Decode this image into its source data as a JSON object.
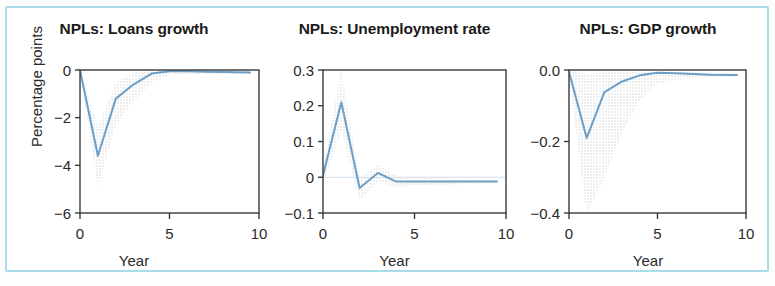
{
  "figure": {
    "border_color": "#a8dce8",
    "background": "#ffffff",
    "line_color": "#6d9ec6",
    "band_color": "#d6d6d6"
  },
  "panels": [
    {
      "id": "npls-loans-growth",
      "title": "NPLs: Loans growth",
      "xlabel": "Year",
      "ylabel": "Percentage points",
      "yticks": [
        "0",
        "−2",
        "−4",
        "−6"
      ],
      "xticks": [
        "0",
        "5",
        "10"
      ]
    },
    {
      "id": "npls-unemployment-rate",
      "title": "NPLs: Unemployment rate",
      "xlabel": "Year",
      "ylabel": "",
      "yticks": [
        "0.3",
        "0.2",
        "0.1",
        "0",
        "−0.1"
      ],
      "xticks": [
        "0",
        "5",
        "10"
      ]
    },
    {
      "id": "npls-gdp-growth",
      "title": "NPLs: GDP growth",
      "xlabel": "Year",
      "ylabel": "",
      "yticks": [
        "0.0",
        "−0.2",
        "−0.4"
      ],
      "xticks": [
        "0",
        "5",
        "10"
      ]
    }
  ],
  "chart_data": [
    {
      "type": "line",
      "title": "NPLs: Loans growth",
      "xlabel": "Year",
      "ylabel": "Percentage points",
      "xlim": [
        0,
        10
      ],
      "ylim": [
        -6,
        0
      ],
      "xticks": [
        0,
        5,
        10
      ],
      "yticks": [
        0,
        -2,
        -4,
        -6
      ],
      "grid": false,
      "legend": "none",
      "x": [
        0,
        1,
        2,
        3,
        4,
        5,
        6,
        7,
        8,
        9.5
      ],
      "series": [
        {
          "name": "impulse response",
          "values": [
            0.0,
            -3.6,
            -1.2,
            -0.6,
            -0.15,
            -0.05,
            -0.05,
            -0.07,
            -0.08,
            -0.1
          ]
        },
        {
          "name": "confidence band upper",
          "values": [
            0.05,
            -2.4,
            -0.5,
            -0.1,
            0.02,
            0.03,
            0.02,
            0.0,
            -0.02,
            -0.04
          ]
        },
        {
          "name": "confidence band lower",
          "values": [
            -0.1,
            -4.9,
            -2.3,
            -1.3,
            -0.55,
            -0.22,
            -0.18,
            -0.18,
            -0.18,
            -0.2
          ]
        }
      ]
    },
    {
      "type": "line",
      "title": "NPLs: Unemployment rate",
      "xlabel": "Year",
      "ylabel": "",
      "xlim": [
        0,
        10
      ],
      "ylim": [
        -0.1,
        0.3
      ],
      "xticks": [
        0,
        5,
        10
      ],
      "yticks": [
        0.3,
        0.2,
        0.1,
        0,
        -0.1
      ],
      "grid": false,
      "legend": "none",
      "x": [
        0,
        1,
        2,
        3,
        4,
        5,
        6,
        7,
        8,
        9.5
      ],
      "series": [
        {
          "name": "impulse response",
          "values": [
            0.005,
            0.21,
            -0.03,
            0.012,
            -0.012,
            -0.012,
            -0.012,
            -0.012,
            -0.012,
            -0.012
          ]
        },
        {
          "name": "confidence band upper",
          "values": [
            0.03,
            0.3,
            0.0,
            0.035,
            0.005,
            0.0,
            -0.002,
            -0.004,
            -0.006,
            -0.008
          ]
        },
        {
          "name": "confidence band lower",
          "values": [
            -0.02,
            0.13,
            -0.065,
            -0.012,
            -0.028,
            -0.024,
            -0.022,
            -0.02,
            -0.018,
            -0.018
          ]
        }
      ]
    },
    {
      "type": "line",
      "title": "NPLs: GDP growth",
      "xlabel": "Year",
      "ylabel": "",
      "xlim": [
        0,
        10
      ],
      "ylim": [
        -0.4,
        0.0
      ],
      "xticks": [
        0,
        5,
        10
      ],
      "yticks": [
        0.0,
        -0.2,
        -0.4
      ],
      "grid": false,
      "legend": "none",
      "x": [
        0,
        1,
        2,
        3,
        4,
        5,
        6,
        7,
        8,
        9.5
      ],
      "series": [
        {
          "name": "impulse response",
          "values": [
            -0.005,
            -0.19,
            -0.062,
            -0.032,
            -0.015,
            -0.008,
            -0.009,
            -0.011,
            -0.013,
            -0.014
          ]
        },
        {
          "name": "confidence band upper",
          "values": [
            0.0,
            -0.012,
            -0.006,
            -0.004,
            -0.002,
            -0.002,
            -0.004,
            -0.006,
            -0.008,
            -0.01
          ]
        },
        {
          "name": "confidence band lower",
          "values": [
            -0.02,
            -0.4,
            -0.3,
            -0.175,
            -0.085,
            -0.04,
            -0.028,
            -0.024,
            -0.022,
            -0.02
          ]
        }
      ]
    }
  ]
}
